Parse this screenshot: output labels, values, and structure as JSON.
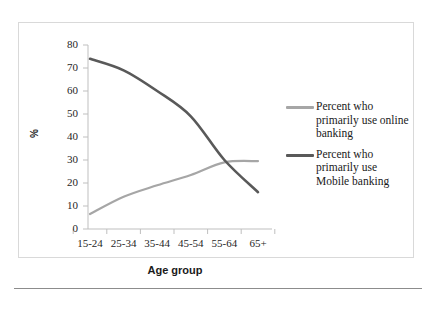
{
  "figure": {
    "y_axis_title": "%",
    "x_axis_title": "Age group"
  },
  "legend": {
    "items": [
      {
        "label": "Percent who primarily use online banking",
        "color": "#a6a6a6",
        "icon": "line-swatch-icon"
      },
      {
        "label": "Percent who primarily use Mobile banking",
        "color": "#595959",
        "icon": "line-swatch-icon"
      }
    ]
  },
  "chart_data": {
    "type": "line",
    "title": "",
    "xlabel": "Age group",
    "ylabel": "%",
    "categories": [
      "15-24",
      "25-34",
      "35-44",
      "45-54",
      "55-64",
      "65+"
    ],
    "ylim": [
      0,
      80
    ],
    "yticks": [
      0,
      10,
      20,
      30,
      40,
      50,
      60,
      70,
      80
    ],
    "ytick_labels": [
      "0",
      "10",
      "20",
      "30",
      "40",
      "50",
      "60",
      "70",
      "80"
    ],
    "grid": false,
    "legend_position": "right",
    "series": [
      {
        "name": "Percent who primarily use online banking",
        "color": "#a6a6a6",
        "values": [
          6.5,
          14,
          19,
          23.5,
          29,
          29.5
        ]
      },
      {
        "name": "Percent who primarily use Mobile banking",
        "color": "#595959",
        "values": [
          74,
          69,
          60,
          49,
          30,
          16
        ]
      }
    ]
  }
}
